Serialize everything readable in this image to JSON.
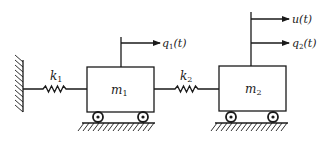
{
  "diagram": {
    "type": "two-mass spring system",
    "colors": {
      "ink": "#1a1a1a",
      "background": "#ffffff"
    },
    "wall": {
      "label": ""
    },
    "springs": [
      {
        "id": "k1",
        "symbol": "k",
        "subscript": "1"
      },
      {
        "id": "k2",
        "symbol": "k",
        "subscript": "2"
      }
    ],
    "masses": [
      {
        "id": "m1",
        "symbol": "m",
        "subscript": "1"
      },
      {
        "id": "m2",
        "symbol": "m",
        "subscript": "2"
      }
    ],
    "arrows": [
      {
        "id": "q1",
        "symbol": "q",
        "subscript": "1",
        "arg": "(t)"
      },
      {
        "id": "u",
        "symbol": "u",
        "subscript": "",
        "arg": "(t)"
      },
      {
        "id": "q2",
        "symbol": "q",
        "subscript": "2",
        "arg": "(t)"
      }
    ]
  }
}
